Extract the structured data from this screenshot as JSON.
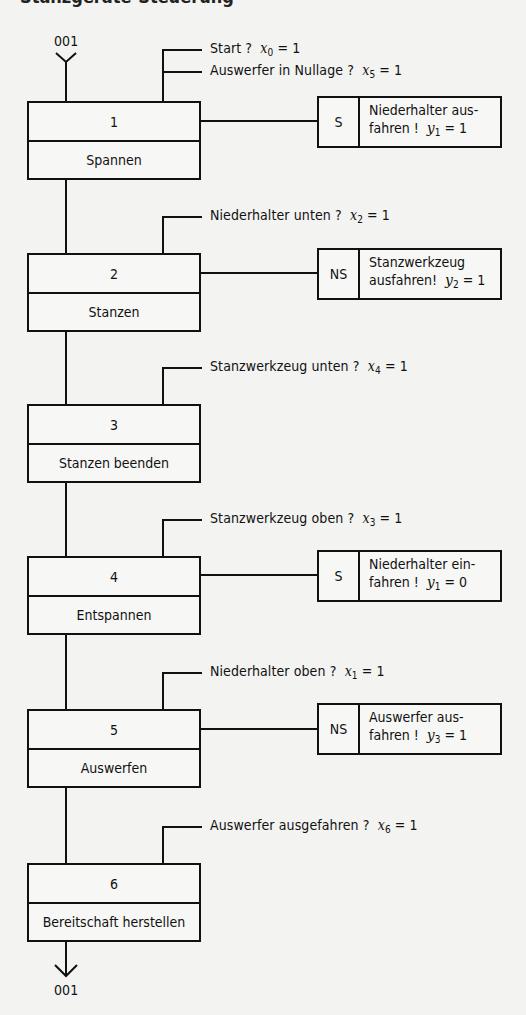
{
  "heading": "Stanzgeräte-Steuerung",
  "connector": {
    "entry_label": "001",
    "exit_label": "001"
  },
  "steps": [
    {
      "number": "1",
      "name": "Spannen",
      "transitions": [
        {
          "text": "Start ?",
          "var": "x",
          "idx": "0",
          "val": "= 1"
        },
        {
          "text": "Auswerfer in Nullage ?",
          "var": "x",
          "idx": "5",
          "val": "= 1"
        }
      ],
      "action": {
        "qualifier": "S",
        "line1": "Niederhalter aus-",
        "line2": "fahren !",
        "var": "y",
        "idx": "1",
        "val": "= 1"
      }
    },
    {
      "number": "2",
      "name": "Stanzen",
      "transitions": [
        {
          "text": "Niederhalter unten ?",
          "var": "x",
          "idx": "2",
          "val": "= 1"
        }
      ],
      "action": {
        "qualifier": "NS",
        "line1": "Stanzwerkzeug",
        "line2": "ausfahren!",
        "var": "y",
        "idx": "2",
        "val": "= 1"
      }
    },
    {
      "number": "3",
      "name": "Stanzen beenden",
      "transitions": [
        {
          "text": "Stanzwerkzeug unten ?",
          "var": "x",
          "idx": "4",
          "val": "= 1"
        }
      ],
      "action": null
    },
    {
      "number": "4",
      "name": "Entspannen",
      "transitions": [
        {
          "text": "Stanzwerkzeug oben ?",
          "var": "x",
          "idx": "3",
          "val": "= 1"
        }
      ],
      "action": {
        "qualifier": "S",
        "line1": "Niederhalter ein-",
        "line2": "fahren !",
        "var": "y",
        "idx": "1",
        "val": "= 0"
      }
    },
    {
      "number": "5",
      "name": "Auswerfen",
      "transitions": [
        {
          "text": "Niederhalter oben ?",
          "var": "x",
          "idx": "1",
          "val": "= 1"
        }
      ],
      "action": {
        "qualifier": "NS",
        "line1": "Auswerfer aus-",
        "line2": "fahren !",
        "var": "y",
        "idx": "3",
        "val": "= 1"
      }
    },
    {
      "number": "6",
      "name": "Bereitschaft herstellen",
      "transitions": [
        {
          "text": "Auswerfer ausgefahren ?",
          "var": "x",
          "idx": "6",
          "val": "= 1"
        }
      ],
      "action": null
    }
  ]
}
